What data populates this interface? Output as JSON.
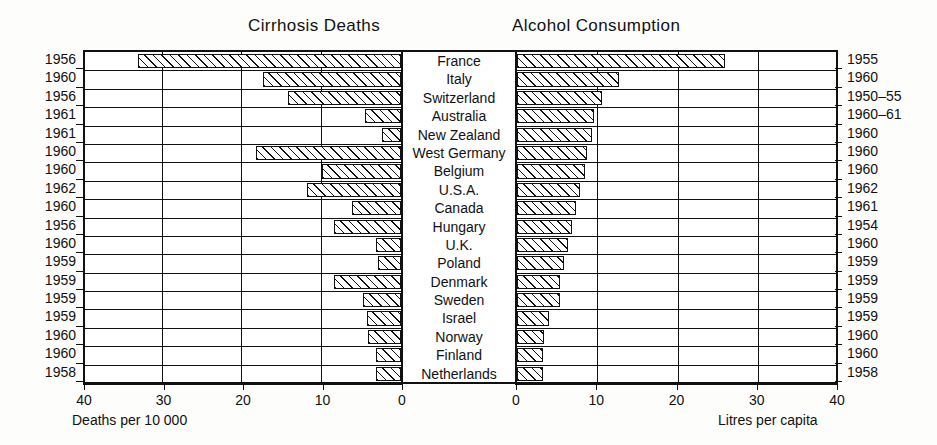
{
  "titles": {
    "left": "Cirrhosis  Deaths",
    "right": "Alcohol  Consumption"
  },
  "axis_captions": {
    "left": "Deaths  per 10 000",
    "right": "Litres  per capita"
  },
  "chart_data": {
    "type": "bar",
    "orientation": "horizontal-bidirectional",
    "categories": [
      "France",
      "Italy",
      "Switzerland",
      "Australia",
      "New Zealand",
      "West Germany",
      "Belgium",
      "U.S.A.",
      "Canada",
      "Hungary",
      "U.K.",
      "Poland",
      "Denmark",
      "Sweden",
      "Israel",
      "Norway",
      "Finland",
      "Netherlands"
    ],
    "series": [
      {
        "name": "Cirrhosis Deaths",
        "xlabel": "Deaths  per 10 000",
        "direction": "left",
        "xlim": [
          40,
          0
        ],
        "ticks": [
          40,
          30,
          20,
          10,
          0
        ],
        "tick_labels": [
          "40",
          "30",
          "20",
          "10",
          "0"
        ],
        "years": [
          "1956",
          "1960",
          "1956",
          "1961",
          "1961",
          "1960",
          "1960",
          "1962",
          "1960",
          "1956",
          "1960",
          "1959",
          "1959",
          "1959",
          "1959",
          "1960",
          "1960",
          "1958"
        ],
        "values": [
          33.1,
          17.4,
          14.2,
          4.5,
          2.4,
          18.3,
          9.9,
          11.8,
          6.2,
          8.4,
          3.1,
          2.9,
          8.4,
          4.8,
          4.3,
          4.2,
          3.1,
          3.1
        ]
      },
      {
        "name": "Alcohol Consumption",
        "xlabel": "Litres  per capita",
        "direction": "right",
        "xlim": [
          0,
          40
        ],
        "ticks": [
          0,
          10,
          20,
          30,
          40
        ],
        "tick_labels": [
          "0",
          "10",
          "20",
          "30",
          "40"
        ],
        "years": [
          "1955",
          "1960",
          "1950–55",
          "1960–61",
          "1960",
          "1960",
          "1960",
          "1962",
          "1961",
          "1954",
          "1960",
          "1959",
          "1959",
          "1959",
          "1959",
          "1960",
          "1960",
          "1958"
        ],
        "values": [
          25.9,
          12.7,
          10.6,
          9.6,
          9.3,
          8.7,
          8.5,
          7.8,
          7.3,
          6.9,
          6.4,
          5.9,
          5.4,
          5.3,
          4.0,
          3.4,
          3.3,
          3.3
        ]
      }
    ],
    "grid": "vertical-and-row-lines",
    "legend": "none"
  }
}
